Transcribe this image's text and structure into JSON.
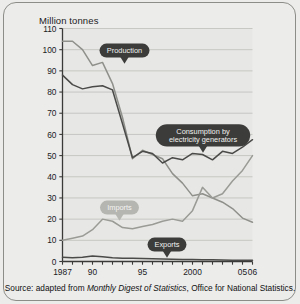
{
  "figure": {
    "y_axis_title": "Million tonnes",
    "caption_prefix": "Source: adapted from ",
    "caption_italic": "Monthly Digest of Statistics",
    "caption_suffix": ", Office for National Statistics."
  },
  "callouts": {
    "production": "Production",
    "consumption_line1": "Consumption by",
    "consumption_line2": "electricity generators",
    "imports": "Imports",
    "exports": "Exports"
  },
  "colors": {
    "background": "#ececeb",
    "plot_background": "#e7e7e5",
    "gridline": "#b8b8b4",
    "axis": "#3a3a38",
    "series_dark": "#4a4a48",
    "series_light": "#9a9a96",
    "callout_dark": "#3c3c3a",
    "callout_light": "#b5b5b1",
    "frame": "#8c8c88"
  },
  "chart_data": {
    "type": "line",
    "title": "",
    "xlabel": "",
    "ylabel": "Million tonnes",
    "ylim": [
      0,
      110
    ],
    "ytick_labels": [
      "0",
      "10",
      "20",
      "30",
      "40",
      "50",
      "60",
      "70",
      "80",
      "90",
      "100",
      "110"
    ],
    "ytick_values": [
      0,
      10,
      20,
      30,
      40,
      50,
      60,
      70,
      80,
      90,
      100,
      110
    ],
    "grid": true,
    "legend_position": "inline-callouts",
    "x": [
      1987,
      1988,
      1989,
      1990,
      1991,
      1992,
      1993,
      1994,
      1995,
      1996,
      1997,
      1998,
      1999,
      2000,
      2001,
      2002,
      2003,
      2004,
      2005,
      2006
    ],
    "xtick_labels": [
      {
        "x": 1987,
        "label": "1987"
      },
      {
        "x": 1990,
        "label": "90"
      },
      {
        "x": 1995,
        "label": "95"
      },
      {
        "x": 2000,
        "label": "2000"
      },
      {
        "x": 2005,
        "label": "05"
      },
      {
        "x": 2006,
        "label": "06"
      }
    ],
    "series": [
      {
        "name": "Production",
        "color": "#8f8f8b",
        "values": [
          104,
          104,
          100,
          92.5,
          94,
          84,
          68,
          48.5,
          52.5,
          50.5,
          48.5,
          41.5,
          37,
          31,
          32,
          30,
          28,
          25,
          20.5,
          18.5
        ]
      },
      {
        "name": "Consumption by electricity generators",
        "color": "#4a4a48",
        "values": [
          88,
          83.5,
          81.5,
          82.5,
          83,
          81,
          65,
          49,
          52,
          51,
          46.5,
          49,
          48,
          51,
          50.5,
          48,
          52,
          51,
          54,
          57.5
        ]
      },
      {
        "name": "Imports",
        "color": "#9a9a96",
        "values": [
          10,
          11,
          12,
          15,
          20,
          19,
          16,
          15.5,
          16.5,
          17.5,
          19,
          20,
          19,
          24,
          35,
          30,
          32,
          38,
          43,
          50
        ]
      },
      {
        "name": "Exports",
        "color": "#4a4a48",
        "values": [
          2,
          1.8,
          2,
          2.6,
          2.3,
          1.8,
          1.5,
          1.5,
          1.4,
          1.3,
          1.2,
          1.1,
          1,
          0.9,
          0.8,
          0.8,
          0.7,
          0.6,
          0.6,
          0.6
        ]
      }
    ],
    "annotations": [
      {
        "text": "Production",
        "series": "Production",
        "style": "dark-callout"
      },
      {
        "text": "Consumption by electricity generators",
        "series": "Consumption by electricity generators",
        "style": "dark-callout"
      },
      {
        "text": "Imports",
        "series": "Imports",
        "style": "light-callout"
      },
      {
        "text": "Exports",
        "series": "Exports",
        "style": "dark-callout"
      }
    ]
  }
}
